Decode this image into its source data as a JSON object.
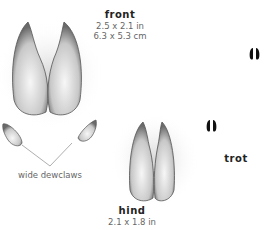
{
  "front": {
    "title": "front",
    "size_in": "2.5 x 2.1 in",
    "size_cm": "6.3 x 5.3 cm"
  },
  "hind": {
    "title": "hind",
    "size_in": "2.1 x 1.8 in"
  },
  "dewclaws": {
    "label": "wide dewclaws"
  },
  "gait": {
    "label": "trot"
  },
  "colors": {
    "track": "#d8d8d8",
    "shadow": "#6a6a6a",
    "text_bold": "#222222",
    "text": "#666666",
    "print": "#111111"
  }
}
